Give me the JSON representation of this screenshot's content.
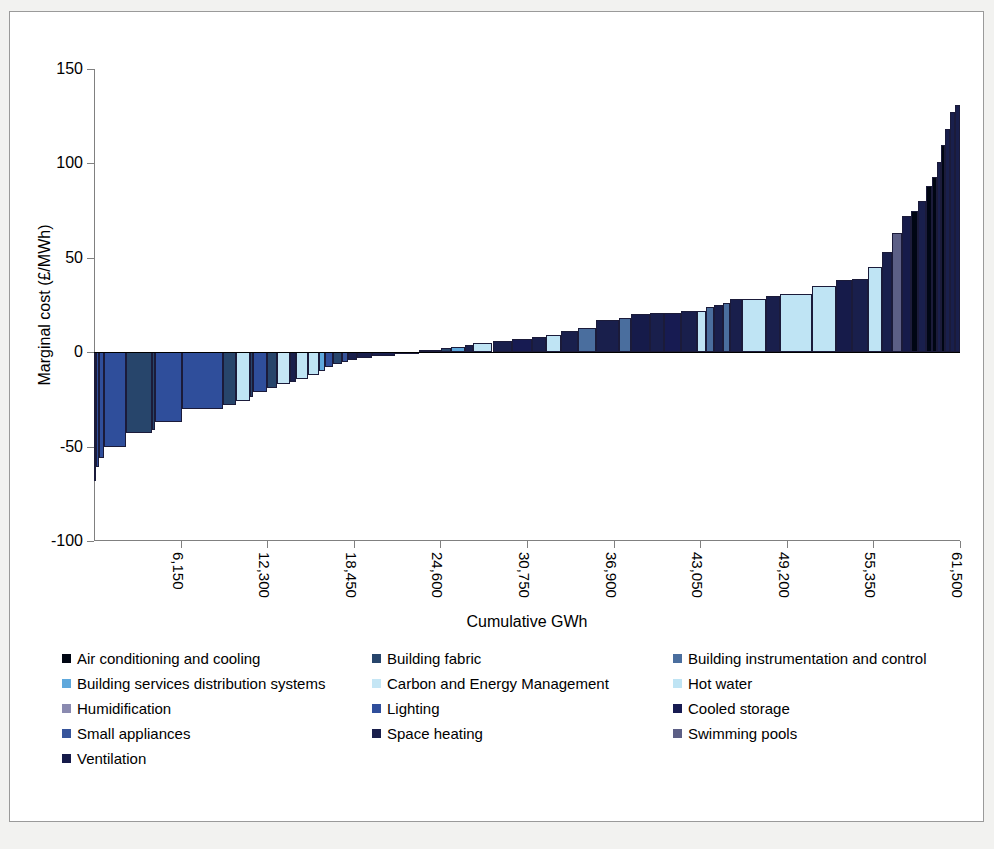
{
  "chart_data": {
    "type": "bar",
    "title": "",
    "xlabel": "Cumulative GWh",
    "ylabel": "Marginal cost (£/MWh)",
    "ylim": [
      -100,
      150
    ],
    "xlim": [
      0,
      61500
    ],
    "ytick_labels": [
      "150",
      "100",
      "50",
      "0",
      "-50",
      "-100"
    ],
    "yticks": [
      150,
      100,
      50,
      0,
      -50,
      -100
    ],
    "xtick_labels": [
      "6,150",
      "12,300",
      "18,450",
      "24,600",
      "30,750",
      "36,900",
      "43,050",
      "49,200",
      "55,350",
      "61,500"
    ],
    "xticks": [
      6150,
      12300,
      18450,
      24600,
      30750,
      36900,
      43050,
      49200,
      55350,
      61500
    ],
    "grid": false,
    "legend_position": "below-plot",
    "note": "Marginal abatement cost curve: each bar width = GWh saved, height = marginal cost (£/MWh), sorted ascending by cost.",
    "bars": [
      {
        "start": 0,
        "width": 140,
        "value": -68,
        "category": "Lighting"
      },
      {
        "start": 140,
        "width": 180,
        "value": -61,
        "category": "Lighting"
      },
      {
        "start": 320,
        "width": 420,
        "value": -56,
        "category": "Lighting"
      },
      {
        "start": 740,
        "width": 1550,
        "value": -50,
        "category": "Lighting"
      },
      {
        "start": 2290,
        "width": 1850,
        "value": -43,
        "category": "Building fabric"
      },
      {
        "start": 4140,
        "width": 180,
        "value": -41,
        "category": "Building fabric"
      },
      {
        "start": 4320,
        "width": 1900,
        "value": -37,
        "category": "Lighting"
      },
      {
        "start": 6220,
        "width": 2950,
        "value": -30,
        "category": "Lighting"
      },
      {
        "start": 9170,
        "width": 880,
        "value": -28,
        "category": "Building fabric"
      },
      {
        "start": 10050,
        "width": 1000,
        "value": -26,
        "category": "Hot water"
      },
      {
        "start": 11050,
        "width": 230,
        "value": -24,
        "category": "Building fabric"
      },
      {
        "start": 11280,
        "width": 980,
        "value": -21,
        "category": "Lighting"
      },
      {
        "start": 12260,
        "width": 740,
        "value": -19,
        "category": "Building fabric"
      },
      {
        "start": 13000,
        "width": 920,
        "value": -17,
        "category": "Carbon and Energy Management"
      },
      {
        "start": 13920,
        "width": 410,
        "value": -16,
        "category": "Space heating"
      },
      {
        "start": 14330,
        "width": 900,
        "value": -14,
        "category": "Hot water"
      },
      {
        "start": 15230,
        "width": 760,
        "value": -12,
        "category": "Hot water"
      },
      {
        "start": 15990,
        "width": 400,
        "value": -10,
        "category": "Building services distribution systems"
      },
      {
        "start": 16390,
        "width": 600,
        "value": -8,
        "category": "Lighting"
      },
      {
        "start": 16990,
        "width": 620,
        "value": -6,
        "category": "Building fabric"
      },
      {
        "start": 17610,
        "width": 430,
        "value": -5,
        "category": "Small appliances"
      },
      {
        "start": 18040,
        "width": 620,
        "value": -4,
        "category": "Space heating"
      },
      {
        "start": 18660,
        "width": 1100,
        "value": -3,
        "category": "Space heating"
      },
      {
        "start": 19760,
        "width": 1650,
        "value": -2,
        "category": "Space heating"
      },
      {
        "start": 21410,
        "width": 1700,
        "value": -1,
        "category": "Ventilation"
      },
      {
        "start": 23110,
        "width": 1500,
        "value": 1,
        "category": "Space heating"
      },
      {
        "start": 24610,
        "width": 740,
        "value": 2,
        "category": "Building fabric"
      },
      {
        "start": 25350,
        "width": 1000,
        "value": 3,
        "category": "Building services distribution systems"
      },
      {
        "start": 26350,
        "width": 600,
        "value": 4,
        "category": "Space heating"
      },
      {
        "start": 26950,
        "width": 1350,
        "value": 5,
        "category": "Hot water"
      },
      {
        "start": 28300,
        "width": 1400,
        "value": 6,
        "category": "Space heating"
      },
      {
        "start": 29700,
        "width": 1400,
        "value": 7,
        "category": "Cooled storage"
      },
      {
        "start": 31100,
        "width": 1000,
        "value": 8,
        "category": "Space heating"
      },
      {
        "start": 32100,
        "width": 1100,
        "value": 9,
        "category": "Hot water"
      },
      {
        "start": 33200,
        "width": 1200,
        "value": 11,
        "category": "Space heating"
      },
      {
        "start": 34400,
        "width": 1250,
        "value": 13,
        "category": "Building instrumentation and control"
      },
      {
        "start": 35650,
        "width": 1600,
        "value": 17,
        "category": "Space heating"
      },
      {
        "start": 37250,
        "width": 900,
        "value": 18,
        "category": "Building instrumentation and control"
      },
      {
        "start": 38150,
        "width": 1350,
        "value": 20,
        "category": "Ventilation"
      },
      {
        "start": 39500,
        "width": 950,
        "value": 21,
        "category": "Space heating"
      },
      {
        "start": 40450,
        "width": 1250,
        "value": 21,
        "category": "Cooled storage"
      },
      {
        "start": 41700,
        "width": 1100,
        "value": 22,
        "category": "Space heating"
      },
      {
        "start": 42800,
        "width": 650,
        "value": 22,
        "category": "Hot water"
      },
      {
        "start": 43450,
        "width": 600,
        "value": 24,
        "category": "Building instrumentation and control"
      },
      {
        "start": 44050,
        "width": 600,
        "value": 25,
        "category": "Space heating"
      },
      {
        "start": 44650,
        "width": 500,
        "value": 26,
        "category": "Building instrumentation and control"
      },
      {
        "start": 45150,
        "width": 900,
        "value": 28,
        "category": "Space heating"
      },
      {
        "start": 46050,
        "width": 1700,
        "value": 28,
        "category": "Hot water"
      },
      {
        "start": 47750,
        "width": 950,
        "value": 30,
        "category": "Space heating"
      },
      {
        "start": 48700,
        "width": 2300,
        "value": 31,
        "category": "Hot water"
      },
      {
        "start": 51000,
        "width": 1700,
        "value": 35,
        "category": "Hot water"
      },
      {
        "start": 52700,
        "width": 1100,
        "value": 38,
        "category": "Ventilation"
      },
      {
        "start": 53800,
        "width": 1200,
        "value": 39,
        "category": "Space heating"
      },
      {
        "start": 55000,
        "width": 950,
        "value": 45,
        "category": "Hot water"
      },
      {
        "start": 55950,
        "width": 700,
        "value": 53,
        "category": "Space heating"
      },
      {
        "start": 56650,
        "width": 750,
        "value": 63,
        "category": "Swimming pools"
      },
      {
        "start": 57400,
        "width": 600,
        "value": 72,
        "category": "Ventilation"
      },
      {
        "start": 58000,
        "width": 500,
        "value": 75,
        "category": "Air conditioning and cooling"
      },
      {
        "start": 58500,
        "width": 600,
        "value": 80,
        "category": "Space heating"
      },
      {
        "start": 59100,
        "width": 400,
        "value": 88,
        "category": "Air conditioning and cooling"
      },
      {
        "start": 59500,
        "width": 350,
        "value": 93,
        "category": "Air conditioning and cooling"
      },
      {
        "start": 59850,
        "width": 300,
        "value": 101,
        "category": "Space heating"
      },
      {
        "start": 60150,
        "width": 280,
        "value": 110,
        "category": "Air conditioning and cooling"
      },
      {
        "start": 60430,
        "width": 330,
        "value": 118,
        "category": "Space heating"
      },
      {
        "start": 60760,
        "width": 350,
        "value": 127,
        "category": "Space heating"
      },
      {
        "start": 61110,
        "width": 390,
        "value": 131,
        "category": "Space heating"
      }
    ]
  },
  "legend": {
    "rows": [
      [
        {
          "label": "Air conditioning and cooling",
          "color": "#000613"
        },
        {
          "label": "Building fabric",
          "color": "#27456b"
        },
        {
          "label": "Building instrumentation and control",
          "color": "#4a6e9e"
        }
      ],
      [
        {
          "label": "Building services distribution systems",
          "color": "#5fa8dc"
        },
        {
          "label": "Carbon and Energy Management",
          "color": "#c5e6f5"
        },
        {
          "label": "Hot water",
          "color": "#bfe4f4"
        }
      ],
      [
        {
          "label": "Humidification",
          "color": "#8a8ab0"
        },
        {
          "label": "Lighting",
          "color": "#2f4e9b"
        },
        {
          "label": "Cooled storage",
          "color": "#171b52"
        }
      ],
      [
        {
          "label": "Small appliances",
          "color": "#36549b"
        },
        {
          "label": "Space heating",
          "color": "#191f4c"
        },
        {
          "label": "Swimming pools",
          "color": "#5c5f86"
        }
      ],
      [
        {
          "label": "Ventilation",
          "color": "#161b4a"
        }
      ]
    ]
  },
  "colors": {
    "air-conditioning-and-cooling": "#000613",
    "building-fabric": "#27456b",
    "building-instrumentation-and-control": "#4a6e9e",
    "building-services-distribution-systems": "#5fa8dc",
    "carbon-and-energy-management": "#c5e6f5",
    "hot-water": "#bfe4f4",
    "humidification": "#8a8ab0",
    "lighting": "#2f4e9b",
    "cooled-storage": "#171b52",
    "small-appliances": "#36549b",
    "space-heating": "#191f4c",
    "swimming-pools": "#5c5f86",
    "ventilation": "#161b4a",
    "axis": "#808080",
    "bar-outline": "#1b1b3a",
    "page-background": "#f2f2f0",
    "chart-background": "#ffffff",
    "frame-border": "#9a9a9a"
  }
}
